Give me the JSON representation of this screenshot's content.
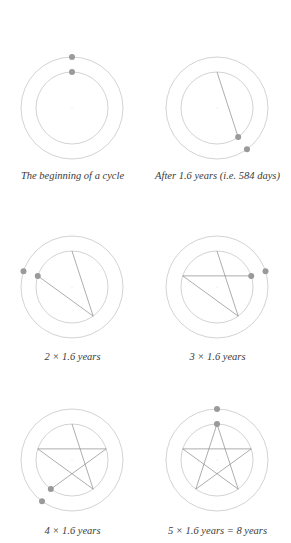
{
  "figure": {
    "colors": {
      "orbit": "#c8c8c8",
      "path": "#8a8a8a",
      "planet": "#9a9a9a",
      "caption": "#3a3a3a"
    },
    "step_degrees": 144,
    "panels": [
      {
        "caption": "The beginning of a cycle",
        "steps": 0
      },
      {
        "caption": "After 1.6 years (i.e. 584 days)",
        "steps": 1
      },
      {
        "caption": "2 × 1.6 years",
        "steps": 2
      },
      {
        "caption": "3 × 1.6 years",
        "steps": 3
      },
      {
        "caption": "4 × 1.6 years",
        "steps": 4
      },
      {
        "caption": "5 × 1.6 years = 8 years",
        "steps": 5
      }
    ]
  }
}
